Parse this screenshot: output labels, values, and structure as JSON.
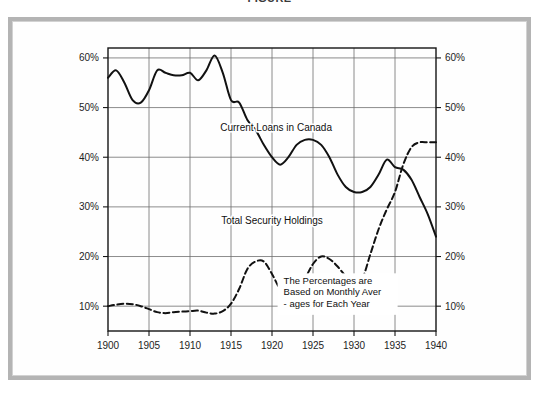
{
  "title": "FIGURE",
  "frame": {
    "outer_border_color": "#b4b4b4",
    "inner_border_color": "#d2d2d2",
    "background_color": "#ffffff"
  },
  "chart_data": {
    "type": "line",
    "title": "FIGURE",
    "xlabel": "",
    "ylabel": "",
    "xlim": [
      1900,
      1940
    ],
    "ylim": [
      5,
      62
    ],
    "grid": true,
    "legend": "inline-annotations",
    "x_ticks": [
      1900,
      1905,
      1910,
      1915,
      1920,
      1925,
      1930,
      1935,
      1940
    ],
    "x_tick_labels": [
      "1900",
      "1905",
      "1910",
      "1915",
      "1920",
      "1925",
      "1930",
      "1935",
      "1940"
    ],
    "y_ticks": [
      10,
      20,
      30,
      40,
      50,
      60
    ],
    "y_tick_labels_left": [
      "10%",
      "20%",
      "30%",
      "40%",
      "50%",
      "60%"
    ],
    "y_tick_labels_right": [
      "10%",
      "20%",
      "30%",
      "40%",
      "50%",
      "60%"
    ],
    "annotations": [
      {
        "name": "current-loans-label",
        "text": "Current Loans in Canada",
        "x": 1920.5,
        "y": 45.2
      },
      {
        "name": "total-security-label",
        "text": "Total Security Holdings",
        "x": 1920.0,
        "y": 26.6
      }
    ],
    "note": {
      "lines": [
        "The Percentages are",
        "Based on Monthly Aver",
        "- ages for Each Year"
      ],
      "x": 1928.0,
      "y": 14.5
    },
    "series": [
      {
        "name": "Current Loans in Canada",
        "style": "solid",
        "color": "#111111",
        "x": [
          1900,
          1901,
          1902,
          1903,
          1904,
          1905,
          1906,
          1907,
          1908,
          1909,
          1910,
          1911,
          1912,
          1913,
          1914,
          1915,
          1916,
          1917,
          1918,
          1919,
          1920,
          1921,
          1922,
          1923,
          1924,
          1925,
          1926,
          1927,
          1928,
          1929,
          1930,
          1931,
          1932,
          1933,
          1934,
          1935,
          1936,
          1937,
          1938,
          1939,
          1940
        ],
        "values": [
          56.0,
          57.5,
          55.0,
          51.5,
          51.0,
          53.5,
          57.5,
          57.0,
          56.5,
          56.5,
          57.0,
          55.5,
          57.5,
          60.5,
          57.0,
          51.5,
          51.0,
          47.5,
          45.5,
          42.5,
          40.0,
          38.5,
          40.0,
          42.5,
          43.5,
          43.5,
          42.5,
          40.0,
          36.5,
          34.0,
          33.0,
          33.0,
          34.0,
          36.5,
          39.5,
          38.0,
          37.5,
          35.5,
          32.0,
          28.5,
          24.0
        ],
        "notes": "Peak ~60.5% in 1913; trough ~33% in 1930-31; secondary peak ~39.5% in 1934; ends ~24% in 1940"
      },
      {
        "name": "Total Security Holdings",
        "style": "dashed",
        "color": "#111111",
        "x": [
          1900,
          1901,
          1902,
          1903,
          1904,
          1905,
          1906,
          1907,
          1908,
          1909,
          1910,
          1911,
          1912,
          1913,
          1914,
          1915,
          1916,
          1917,
          1918,
          1919,
          1920,
          1921,
          1922,
          1923,
          1924,
          1925,
          1926,
          1927,
          1928,
          1929,
          1930,
          1931,
          1932,
          1933,
          1934,
          1935,
          1936,
          1937,
          1938,
          1939,
          1940
        ],
        "values": [
          10.0,
          10.3,
          10.5,
          10.4,
          10.0,
          9.4,
          8.8,
          8.6,
          8.8,
          8.9,
          9.0,
          9.1,
          8.7,
          8.5,
          9.0,
          10.5,
          13.5,
          17.5,
          19.0,
          19.0,
          16.5,
          13.5,
          13.0,
          13.2,
          15.5,
          18.5,
          20.0,
          19.5,
          18.0,
          16.0,
          14.5,
          15.5,
          20.5,
          25.5,
          29.5,
          33.0,
          38.5,
          42.0,
          43.0,
          43.0,
          43.0
        ],
        "notes": "Flat ~9-10% until 1915; peaks ~19% 1918-19; dip to 13%; peak ~20% 1926; trough ~14.5% 1930; steep rise to ~43% by 1938, flat through 1940"
      }
    ]
  }
}
